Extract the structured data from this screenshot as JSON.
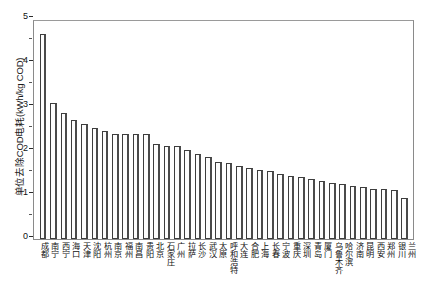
{
  "chart_data": {
    "type": "bar",
    "title": "",
    "subtitle": "",
    "xlabel": "",
    "ylabel": "单位去除COD电耗(kWh/kg COD)",
    "ylim": [
      0,
      5
    ],
    "yticks": [
      0,
      1,
      2,
      3,
      4,
      5
    ],
    "ytick_labels": [
      "0",
      "1",
      "2",
      "3",
      "4",
      "5"
    ],
    "grid": false,
    "legend": null,
    "legend_position": "none",
    "series_name": "单位去除COD电耗",
    "categories": [
      "成都",
      "南宁",
      "西宁",
      "海口",
      "天津",
      "沈阳",
      "杭州",
      "南京",
      "福州",
      "南昌",
      "贵阳",
      "北京",
      "石家庄",
      "广州",
      "拉萨",
      "长沙",
      "武汉",
      "太原",
      "呼和浩特",
      "大连",
      "合肥",
      "上海",
      "长春",
      "宁波",
      "重庆",
      "深圳",
      "青岛",
      "厦门",
      "乌鲁木齐",
      "哈尔滨",
      "济南",
      "昆明",
      "西安",
      "郑州",
      "银川",
      "兰州"
    ],
    "values": [
      4.7,
      3.11,
      2.89,
      2.74,
      2.64,
      2.55,
      2.48,
      2.4,
      2.4,
      2.4,
      2.4,
      2.17,
      2.13,
      2.13,
      2.04,
      1.96,
      1.87,
      1.76,
      1.74,
      1.68,
      1.62,
      1.58,
      1.55,
      1.49,
      1.44,
      1.42,
      1.37,
      1.33,
      1.29,
      1.27,
      1.22,
      1.2,
      1.14,
      1.14,
      1.13,
      0.95
    ]
  }
}
